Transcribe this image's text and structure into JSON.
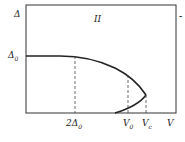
{
  "diagram": {
    "y_axis_label": "Δ",
    "region_label": "II",
    "right_edge_mark": "˗",
    "y_tick": {
      "label": "Δ",
      "subscript": "0"
    },
    "x_ticks": [
      {
        "label": "2Δ",
        "subscript": "0"
      },
      {
        "label": "V",
        "subscript": "0"
      },
      {
        "label": "V",
        "subscript": "c"
      }
    ],
    "x_axis_label": "V",
    "colors": {
      "line": "#222222",
      "background": "#ffffff"
    }
  }
}
